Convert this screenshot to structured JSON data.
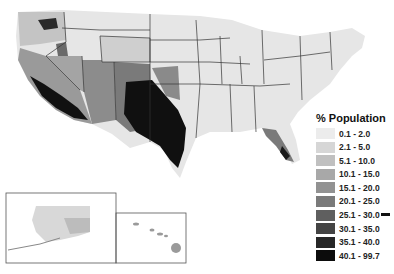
{
  "legend": {
    "title": "% Population",
    "items": [
      {
        "label": "0.1 - 2.0",
        "color": "#ececec"
      },
      {
        "label": "2.1 - 5.0",
        "color": "#d6d6d6"
      },
      {
        "label": "5.1 - 10.0",
        "color": "#c0c0c0"
      },
      {
        "label": "10.1 - 15.0",
        "color": "#a8a8a8"
      },
      {
        "label": "15.1 - 20.0",
        "color": "#929292"
      },
      {
        "label": "20.1 - 25.0",
        "color": "#7a7a7a"
      },
      {
        "label": "25.1 - 30.0",
        "color": "#5f5f5f"
      },
      {
        "label": "30.1 - 35.0",
        "color": "#444444"
      },
      {
        "label": "35.1 - 40.0",
        "color": "#272727"
      },
      {
        "label": "40.1 - 99.7",
        "color": "#0c0c0c"
      }
    ]
  },
  "insets": [
    "Alaska",
    "Hawaii"
  ]
}
